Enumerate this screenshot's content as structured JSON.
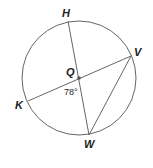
{
  "diagram": {
    "type": "circle-geometry",
    "center": {
      "label": "Q",
      "x": 79,
      "y": 78
    },
    "radius": 57,
    "points": [
      {
        "label": "H",
        "x": 68,
        "y": 21
      },
      {
        "label": "V",
        "x": 131,
        "y": 56
      },
      {
        "label": "K",
        "x": 28,
        "y": 101
      },
      {
        "label": "W",
        "x": 89,
        "y": 135
      }
    ],
    "segments": [
      {
        "from": "H",
        "to": "W",
        "kind": "diameter"
      },
      {
        "from": "K",
        "to": "V",
        "kind": "diameter"
      },
      {
        "from": "V",
        "to": "W",
        "kind": "chord"
      }
    ],
    "angle": {
      "label": "78°",
      "vertex": "Q",
      "between": [
        "K",
        "W"
      ]
    },
    "colors": {
      "stroke": "#555555",
      "text": "#222222"
    }
  }
}
